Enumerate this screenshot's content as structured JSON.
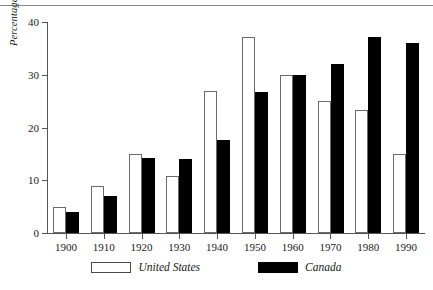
{
  "chart_data": {
    "type": "bar",
    "title": "",
    "subtitle": "",
    "xlabel": "",
    "ylabel": "Percentage of nonagricultural workers",
    "categories": [
      "1900",
      "1910",
      "1920",
      "1930",
      "1940",
      "1950",
      "1960",
      "1970",
      "1980",
      "1990"
    ],
    "series": [
      {
        "name": "United States",
        "color": "#ffffff",
        "values": [
          5,
          9,
          15,
          10.8,
          27,
          37.2,
          30,
          25,
          23.4,
          15
        ]
      },
      {
        "name": "Canada",
        "color": "#000000",
        "values": [
          4,
          7,
          14.2,
          14.1,
          17.6,
          26.8,
          30,
          32,
          37.2,
          36
        ]
      }
    ],
    "ylim": [
      0,
      40
    ],
    "y_ticks": [
      "0",
      "10",
      "20",
      "30",
      "40"
    ],
    "y_tick_values": [
      0,
      10,
      20,
      30,
      40
    ],
    "grid": false,
    "legend_position": "bottom"
  },
  "axes": {
    "y_title": "Percentage of nonagricultural workers"
  },
  "legend": {
    "items": [
      {
        "label": "United States",
        "swatch": "white-square-swatch"
      },
      {
        "label": "Canada",
        "swatch": "black-square-swatch"
      }
    ]
  }
}
